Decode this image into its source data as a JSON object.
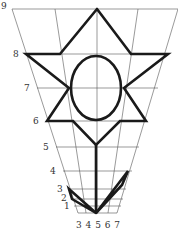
{
  "figure": {
    "row_labels": [
      "9",
      "8",
      "7",
      "6",
      "5",
      "4",
      "3",
      "2",
      "1"
    ],
    "column_labels": "3 4 5 6 7",
    "colors": {
      "line": "#1a1a1a",
      "grid": "#555555",
      "background": "#ffffff"
    }
  }
}
